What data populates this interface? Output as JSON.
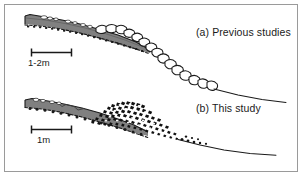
{
  "figure": {
    "panels": [
      {
        "id": "a",
        "label": "(a) Previous studies",
        "scale_bar": {
          "label": "1-2m",
          "name": "scale-bar-a"
        },
        "deposit_style": "large-rounded-blocks",
        "wedge_fill": "#808080"
      },
      {
        "id": "b",
        "label": "(b) This study",
        "scale_bar": {
          "label": "1m",
          "name": "scale-bar-b"
        },
        "deposit_style": "fine-angular-fragments",
        "wedge_fill": "#808080"
      }
    ],
    "colors": {
      "frame": "#9a9a9a",
      "background": "#ffffff",
      "ink": "#1a1a1a",
      "wedge_gray": "#808080",
      "wedge_gray_dark": "#6e6e6e"
    }
  }
}
